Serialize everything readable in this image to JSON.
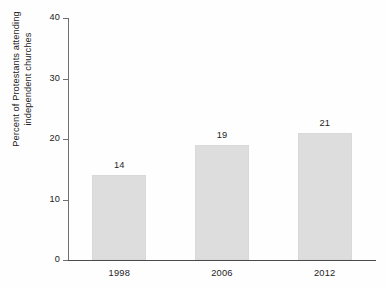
{
  "chart_data": {
    "type": "bar",
    "title": "",
    "subtitle": "",
    "xlabel": "",
    "ylabel": "Percent of Protestants attending independent churches",
    "ylabel_lines": [
      "Percent of Protestants attending",
      "independent churches"
    ],
    "categories": [
      "1998",
      "2006",
      "2012"
    ],
    "values": [
      14,
      19,
      21
    ],
    "value_labels": [
      "14",
      "19",
      "21"
    ],
    "ylim": [
      0,
      40
    ],
    "ytick_values": [
      0,
      10,
      20,
      30,
      40
    ],
    "ytick_labels": [
      "0",
      "10",
      "20",
      "30",
      "40"
    ],
    "grid": false,
    "legend": false,
    "legend_position": "none",
    "bar_color": "#dddddd",
    "axis_color": "#4a4a4a",
    "text_color": "#1d1d1d",
    "background_color": "#fefefe"
  }
}
